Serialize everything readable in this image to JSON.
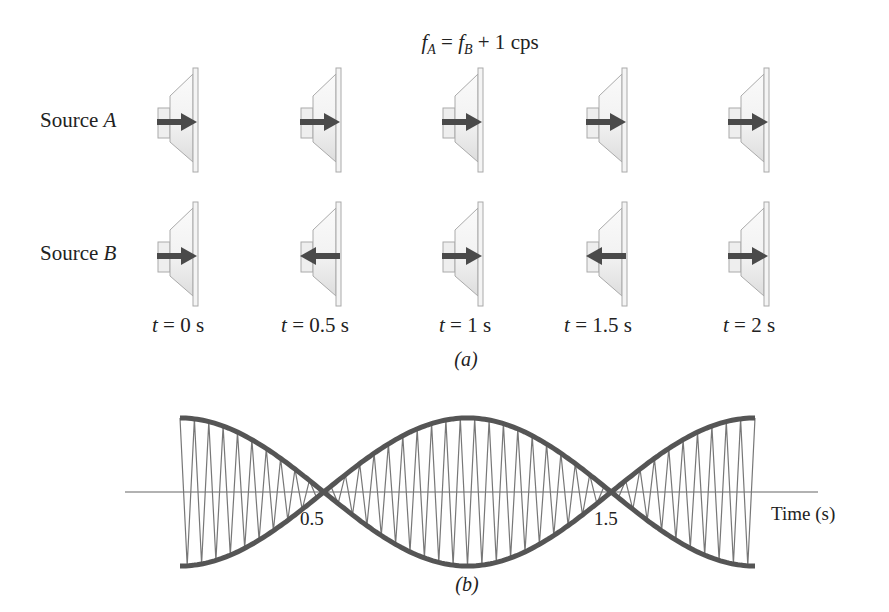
{
  "title": {
    "lhs_var": "f",
    "lhs_sub": "A",
    "eq": "=",
    "rhs_var": "f",
    "rhs_sub": "B",
    "plus": "+ 1",
    "unit": "cps"
  },
  "panel_a": {
    "caption": "(a)",
    "rows": [
      {
        "label_prefix": "Source",
        "label_var": "A",
        "arrows": [
          "right",
          "right",
          "right",
          "right",
          "right"
        ]
      },
      {
        "label_prefix": "Source",
        "label_var": "B",
        "arrows": [
          "right",
          "left",
          "right",
          "left",
          "right"
        ]
      }
    ],
    "times": [
      {
        "var": "t",
        "eq": "=",
        "value": "0 s"
      },
      {
        "var": "t",
        "eq": "=",
        "value": "0.5 s"
      },
      {
        "var": "t",
        "eq": "=",
        "value": "1 s"
      },
      {
        "var": "t",
        "eq": "=",
        "value": "1.5 s"
      },
      {
        "var": "t",
        "eq": "=",
        "value": "2 s"
      }
    ]
  },
  "panel_b": {
    "caption": "(b)",
    "xlabel": "Time (s)",
    "ticks": [
      "0.5",
      "1.5"
    ]
  },
  "colors": {
    "arrow": "#4a4a4a",
    "envelope": "#555555",
    "wave": "#777777",
    "speaker_outline": "#aaaaaa",
    "speaker_fill": "#dddddd"
  },
  "chart_data": {
    "type": "line",
    "xlabel": "Time (s)",
    "ylabel": "",
    "xlim": [
      0,
      2
    ],
    "tick_labels": [
      "0.5",
      "1.5"
    ],
    "series": [
      {
        "name": "envelope",
        "description": "|cos(pi t)| envelope, nodes at t=0.5 and t=1.5, max at t=0, 1, 2"
      },
      {
        "name": "carrier",
        "description": "rapid oscillation (~20 cycles per second) bounded by envelope"
      }
    ],
    "nodes_t": [
      0.5,
      1.5
    ],
    "maxima_t": [
      0,
      1,
      2
    ]
  }
}
